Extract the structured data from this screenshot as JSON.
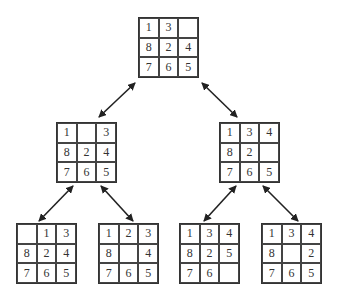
{
  "diagram": {
    "type": "8-puzzle search tree",
    "nodes": [
      {
        "id": "root",
        "level": 0,
        "cells": [
          "1",
          "3",
          "",
          "8",
          "2",
          "4",
          "7",
          "6",
          "5"
        ],
        "pos": {
          "x": 138,
          "y": 17
        }
      },
      {
        "id": "l1-left",
        "level": 1,
        "cells": [
          "1",
          "",
          "3",
          "8",
          "2",
          "4",
          "7",
          "6",
          "5"
        ],
        "pos": {
          "x": 56,
          "y": 122
        }
      },
      {
        "id": "l1-right",
        "level": 1,
        "cells": [
          "1",
          "3",
          "4",
          "8",
          "2",
          "",
          "7",
          "6",
          "5"
        ],
        "pos": {
          "x": 219,
          "y": 122
        }
      },
      {
        "id": "l2-a",
        "level": 2,
        "cells": [
          "",
          "1",
          "3",
          "8",
          "2",
          "4",
          "7",
          "6",
          "5"
        ],
        "pos": {
          "x": 16,
          "y": 223
        }
      },
      {
        "id": "l2-b",
        "level": 2,
        "cells": [
          "1",
          "2",
          "3",
          "8",
          "",
          "4",
          "7",
          "6",
          "5"
        ],
        "pos": {
          "x": 98,
          "y": 223
        }
      },
      {
        "id": "l2-c",
        "level": 2,
        "cells": [
          "1",
          "3",
          "4",
          "8",
          "2",
          "5",
          "7",
          "6",
          ""
        ],
        "pos": {
          "x": 179,
          "y": 223
        }
      },
      {
        "id": "l2-d",
        "level": 2,
        "cells": [
          "1",
          "3",
          "4",
          "8",
          "",
          "2",
          "7",
          "6",
          "5"
        ],
        "pos": {
          "x": 261,
          "y": 223
        }
      }
    ],
    "edges": [
      {
        "from": "root",
        "to": "l1-left",
        "bidirectional": true,
        "x1": 135,
        "y1": 83,
        "x2": 99,
        "y2": 117
      },
      {
        "from": "root",
        "to": "l1-right",
        "bidirectional": true,
        "x1": 202,
        "y1": 83,
        "x2": 237,
        "y2": 117
      },
      {
        "from": "l1-left",
        "to": "l2-a",
        "bidirectional": true,
        "x1": 73,
        "y1": 186,
        "x2": 39,
        "y2": 221
      },
      {
        "from": "l1-left",
        "to": "l2-b",
        "bidirectional": true,
        "x1": 101,
        "y1": 186,
        "x2": 133,
        "y2": 221
      },
      {
        "from": "l1-right",
        "to": "l2-c",
        "bidirectional": true,
        "x1": 236,
        "y1": 186,
        "x2": 204,
        "y2": 221
      },
      {
        "from": "l1-right",
        "to": "l2-d",
        "bidirectional": true,
        "x1": 263,
        "y1": 186,
        "x2": 298,
        "y2": 221
      }
    ],
    "colors": {
      "line": "#222222",
      "text": "#333333",
      "background": "#ffffff"
    }
  }
}
